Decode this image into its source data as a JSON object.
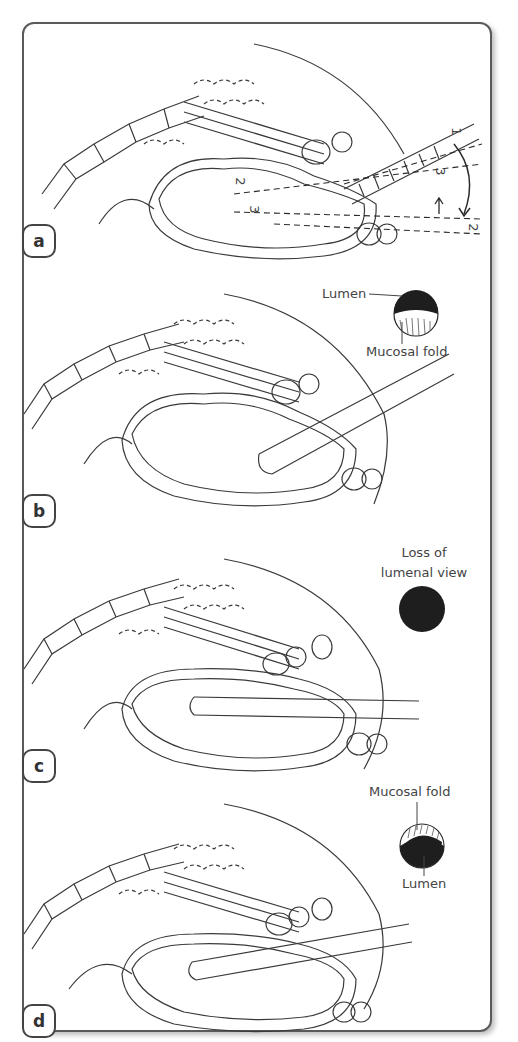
{
  "figure": {
    "panels": [
      {
        "id": "a",
        "label": "a",
        "annotations": {
          "angle_marks": [
            "1",
            "2",
            "3"
          ],
          "inner_marks": [
            "2",
            "3"
          ]
        }
      },
      {
        "id": "b",
        "label": "b",
        "inset": {
          "top_label": "Lumen",
          "bottom_label": "Mucosal fold",
          "view": "partial-lumen"
        }
      },
      {
        "id": "c",
        "label": "c",
        "inset": {
          "line1": "Loss of",
          "line2": "lumenal view",
          "view": "no-lumen"
        }
      },
      {
        "id": "d",
        "label": "d",
        "inset": {
          "top_label": "Mucosal fold",
          "bottom_label": "Lumen",
          "view": "partial-lumen-inverted"
        }
      }
    ],
    "colors": {
      "stroke": "#3a3a3a",
      "frame": "#5a5a5a",
      "lumen": "#1e1e1e",
      "text": "#444444"
    }
  }
}
